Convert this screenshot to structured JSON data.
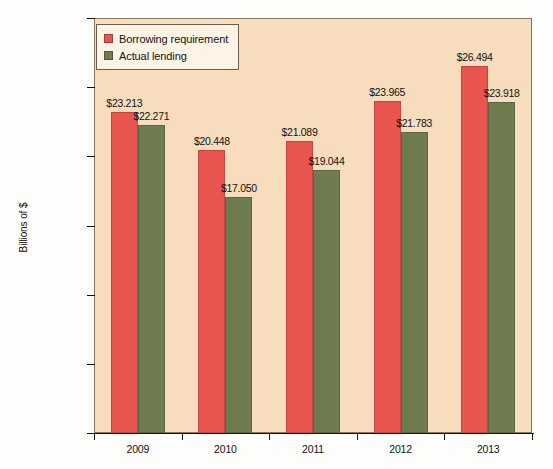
{
  "chart_data": {
    "type": "bar",
    "title": "",
    "subtitle": "",
    "xlabel": "",
    "ylabel": "Billions of $",
    "categories": [
      "2009",
      "2010",
      "2011",
      "2012",
      "2013"
    ],
    "series": [
      {
        "name": "Borrowing requirement",
        "color": "#e8554f",
        "values": [
          23.213,
          20.448,
          21.089,
          23.965,
          26.494
        ],
        "labels": [
          "$23.213",
          "$20.448",
          "$21.089",
          "$23.965",
          "$26.494"
        ]
      },
      {
        "name": "Actual lending",
        "color": "#6e7c4f",
        "values": [
          22.271,
          17.05,
          19.044,
          21.783,
          23.918
        ],
        "labels": [
          "$22.271",
          "$17.050",
          "$19.044",
          "$21.783",
          "$23.918"
        ]
      }
    ],
    "ylim": [
      0,
      30
    ],
    "yticks": [
      0,
      5,
      10,
      15,
      20,
      25,
      30
    ],
    "ytick_labels": [
      "$0",
      "$5.000",
      "$10.000",
      "$15.000",
      "$20.000",
      "$25.000",
      "$30.000"
    ],
    "grid": false,
    "legend_position": "top-left",
    "plot_background": "#f7ddbd",
    "figure_background": "#fdfdfb"
  },
  "legend": {
    "items": [
      {
        "label": "Borrowing requirement",
        "color": "#e8554f"
      },
      {
        "label": "Actual lending",
        "color": "#6e7c4f"
      }
    ]
  }
}
